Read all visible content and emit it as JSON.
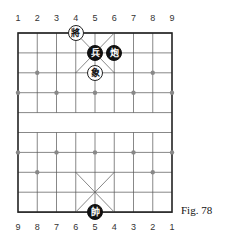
{
  "figure_label": "Fig. 78",
  "top_file_labels": [
    "1",
    "2",
    "3",
    "4",
    "5",
    "6",
    "7",
    "8",
    "9"
  ],
  "bottom_file_labels": [
    "9",
    "8",
    "7",
    "6",
    "5",
    "4",
    "3",
    "2",
    "1"
  ],
  "board": {
    "files": 9,
    "ranks": 10,
    "line_color": "#555555",
    "border_color": "#222222"
  },
  "pieces": [
    {
      "char": "將",
      "side": "white",
      "file": 3,
      "rank": 0
    },
    {
      "char": "兵",
      "side": "black",
      "file": 4,
      "rank": 1
    },
    {
      "char": "炮",
      "side": "black",
      "file": 5,
      "rank": 1
    },
    {
      "char": "象",
      "side": "white",
      "file": 4,
      "rank": 2
    },
    {
      "char": "帥",
      "side": "black",
      "file": 4,
      "rank": 9
    }
  ]
}
